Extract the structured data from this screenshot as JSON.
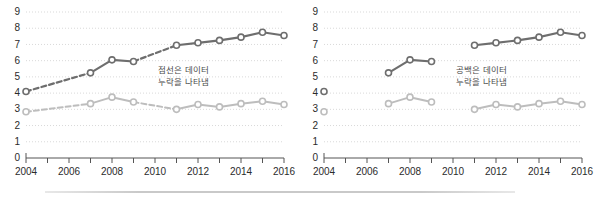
{
  "chart_data": [
    {
      "type": "line",
      "panel": "left",
      "title": "",
      "xlabel": "",
      "ylabel": "",
      "xlim": [
        2004,
        2016
      ],
      "ylim": [
        0,
        9
      ],
      "grid": true,
      "legend": "none",
      "missing_style": "dashed-bridge",
      "annotation": "점선은 데이터\n누락을 나타냄",
      "annotation_line1": "점선은 데이터",
      "annotation_line2": "누락을 나타냄",
      "x_tick_labels": [
        "2004",
        "2006",
        "2008",
        "2010",
        "2012",
        "2014",
        "2016"
      ],
      "y_tick_labels": [
        "0",
        "1",
        "2",
        "3",
        "4",
        "5",
        "6",
        "7",
        "8",
        "9"
      ],
      "x_ticks_minor": [
        2005,
        2007,
        2009,
        2011,
        2013,
        2015
      ],
      "missing_years": [
        2005,
        2006,
        2010
      ],
      "series": [
        {
          "name": "dark",
          "color": "#6e6e6e",
          "x": [
            2004,
            2007,
            2008,
            2009,
            2011,
            2012,
            2013,
            2014,
            2015,
            2016
          ],
          "values": [
            4.1,
            5.25,
            6.05,
            5.95,
            6.95,
            7.1,
            7.25,
            7.45,
            7.75,
            7.55
          ]
        },
        {
          "name": "light",
          "color": "#bdbdbd",
          "x": [
            2004,
            2007,
            2008,
            2009,
            2011,
            2012,
            2013,
            2014,
            2015,
            2016
          ],
          "values": [
            2.85,
            3.35,
            3.75,
            3.45,
            3.0,
            3.3,
            3.15,
            3.35,
            3.5,
            3.3
          ]
        }
      ]
    },
    {
      "type": "line",
      "panel": "right",
      "title": "",
      "xlabel": "",
      "ylabel": "",
      "xlim": [
        2004,
        2016
      ],
      "ylim": [
        0,
        9
      ],
      "grid": true,
      "legend": "none",
      "missing_style": "gap",
      "annotation": "공백은 데이터\n누락을 나타냄",
      "annotation_line1": "공백은 데이터",
      "annotation_line2": "누락을 나타냄",
      "x_tick_labels": [
        "2004",
        "2006",
        "2008",
        "2010",
        "2012",
        "2014",
        "2016"
      ],
      "y_tick_labels": [
        "0",
        "1",
        "2",
        "3",
        "4",
        "5",
        "6",
        "7",
        "8",
        "9"
      ],
      "x_ticks_minor": [
        2005,
        2007,
        2009,
        2011,
        2013,
        2015
      ],
      "missing_years": [
        2005,
        2006,
        2010
      ],
      "series": [
        {
          "name": "dark",
          "color": "#6e6e6e",
          "x": [
            2004,
            2007,
            2008,
            2009,
            2011,
            2012,
            2013,
            2014,
            2015,
            2016
          ],
          "values": [
            4.1,
            5.25,
            6.05,
            5.95,
            6.95,
            7.1,
            7.25,
            7.45,
            7.75,
            7.55
          ]
        },
        {
          "name": "light",
          "color": "#bdbdbd",
          "x": [
            2004,
            2007,
            2008,
            2009,
            2011,
            2012,
            2013,
            2014,
            2015,
            2016
          ],
          "values": [
            2.85,
            3.35,
            3.75,
            3.45,
            3.0,
            3.3,
            3.15,
            3.35,
            3.5,
            3.3
          ]
        }
      ]
    }
  ],
  "style": {
    "grid_color": "#d9d9d9",
    "axis_color": "#555555",
    "marker_fill": "#ffffff",
    "text_color": "#2b2b2b",
    "annotation_color": "#4a4a4a",
    "rule_color": "#c9c9c9"
  }
}
